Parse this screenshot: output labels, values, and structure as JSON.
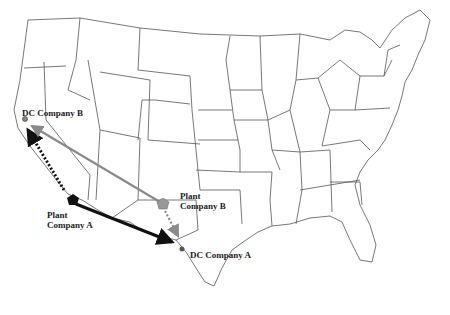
{
  "labels": {
    "dc_b": "DC Company B",
    "plant_a_line1": "Plant",
    "plant_a_line2": "Company A",
    "plant_b_line1": "Plant",
    "plant_b_line2": "Company B",
    "dc_a": "DC Company A"
  },
  "colors": {
    "company_a": "#111111",
    "company_b": "#8a8a8a",
    "borders": "#555555"
  }
}
